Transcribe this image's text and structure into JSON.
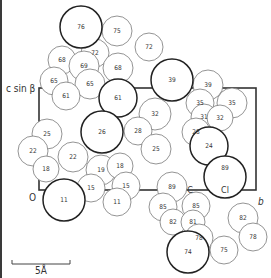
{
  "figure": {
    "type": "crystal-packing-projection",
    "axes": {
      "vertical_label": "c sin β",
      "horizontal_label": "b",
      "origin_label": "O"
    },
    "unit_cell": {
      "x1": 39,
      "y1": 88,
      "x2": 256,
      "y2": 190
    },
    "scale_bar": {
      "label": "5Å",
      "x1": 12,
      "x2": 70,
      "y": 264
    },
    "element_labels": [
      {
        "text": "C",
        "x": 190,
        "y": 188
      },
      {
        "text": "Cl",
        "x": 225,
        "y": 188
      }
    ],
    "atoms": [
      {
        "label": "76",
        "x": 81,
        "y": 27,
        "r": 21,
        "bold": true
      },
      {
        "label": "75",
        "x": 117,
        "y": 31,
        "r": 15
      },
      {
        "label": "72",
        "x": 95,
        "y": 53,
        "r": 14
      },
      {
        "label": "72",
        "x": 149,
        "y": 47,
        "r": 14
      },
      {
        "label": "68",
        "x": 62,
        "y": 60,
        "r": 14
      },
      {
        "label": "69",
        "x": 84,
        "y": 66,
        "r": 15
      },
      {
        "label": "68",
        "x": 118,
        "y": 68,
        "r": 15
      },
      {
        "label": "65",
        "x": 54,
        "y": 81,
        "r": 14
      },
      {
        "label": "65",
        "x": 90,
        "y": 84,
        "r": 15
      },
      {
        "label": "61",
        "x": 66,
        "y": 96,
        "r": 14
      },
      {
        "label": "61",
        "x": 118,
        "y": 98,
        "r": 19,
        "bold": true
      },
      {
        "label": "39",
        "x": 172,
        "y": 80,
        "r": 21,
        "bold": true
      },
      {
        "label": "39",
        "x": 208,
        "y": 85,
        "r": 15
      },
      {
        "label": "35",
        "x": 200,
        "y": 103,
        "r": 14
      },
      {
        "label": "35",
        "x": 232,
        "y": 103,
        "r": 15
      },
      {
        "label": "32",
        "x": 155,
        "y": 114,
        "r": 16
      },
      {
        "label": "31",
        "x": 204,
        "y": 117,
        "r": 13
      },
      {
        "label": "32",
        "x": 220,
        "y": 118,
        "r": 13
      },
      {
        "label": "28",
        "x": 138,
        "y": 131,
        "r": 14
      },
      {
        "label": "28",
        "x": 196,
        "y": 132,
        "r": 14
      },
      {
        "label": "25",
        "x": 156,
        "y": 149,
        "r": 15
      },
      {
        "label": "24",
        "x": 209,
        "y": 146,
        "r": 19,
        "bold": true
      },
      {
        "label": "25",
        "x": 47,
        "y": 134,
        "r": 15
      },
      {
        "label": "26",
        "x": 102,
        "y": 132,
        "r": 21,
        "bold": true
      },
      {
        "label": "22",
        "x": 33,
        "y": 151,
        "r": 15
      },
      {
        "label": "22",
        "x": 73,
        "y": 157,
        "r": 15
      },
      {
        "label": "18",
        "x": 46,
        "y": 169,
        "r": 13
      },
      {
        "label": "19",
        "x": 101,
        "y": 170,
        "r": 15
      },
      {
        "label": "18",
        "x": 120,
        "y": 166,
        "r": 13
      },
      {
        "label": "15",
        "x": 91,
        "y": 188,
        "r": 14
      },
      {
        "label": "15",
        "x": 126,
        "y": 186,
        "r": 14
      },
      {
        "label": "11",
        "x": 64,
        "y": 200,
        "r": 21,
        "bold": true
      },
      {
        "label": "11",
        "x": 117,
        "y": 202,
        "r": 14
      },
      {
        "label": "89",
        "x": 172,
        "y": 187,
        "r": 15
      },
      {
        "label": "89",
        "x": 225,
        "y": 177,
        "r": 21,
        "bold": true
      },
      {
        "label": "85",
        "x": 163,
        "y": 207,
        "r": 14
      },
      {
        "label": "85",
        "x": 196,
        "y": 206,
        "r": 14
      },
      {
        "label": "82",
        "x": 173,
        "y": 222,
        "r": 13
      },
      {
        "label": "81",
        "x": 193,
        "y": 222,
        "r": 12
      },
      {
        "label": "82",
        "x": 243,
        "y": 218,
        "r": 15
      },
      {
        "label": "78",
        "x": 199,
        "y": 238,
        "r": 14
      },
      {
        "label": "78",
        "x": 253,
        "y": 237,
        "r": 14
      },
      {
        "label": "74",
        "x": 188,
        "y": 252,
        "r": 21,
        "bold": true
      },
      {
        "label": "75",
        "x": 224,
        "y": 250,
        "r": 14
      }
    ]
  }
}
